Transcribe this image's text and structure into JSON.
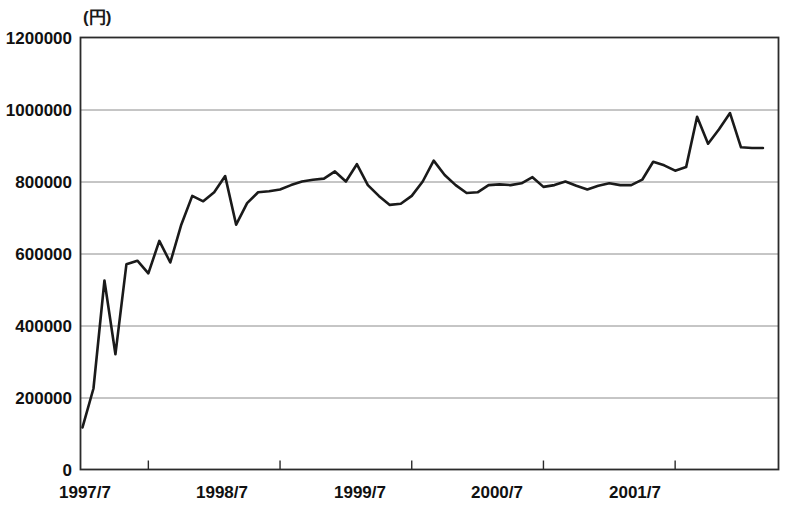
{
  "chart_data": {
    "type": "line",
    "title": "",
    "subtitle": "",
    "unit_label": "(円)",
    "xlabel": "",
    "ylabel": "",
    "ylim": [
      0,
      1200000
    ],
    "xlim": [
      "1997/1",
      "2002/4"
    ],
    "grid": true,
    "legend": "none",
    "y_ticks": [
      0,
      200000,
      400000,
      600000,
      800000,
      1000000,
      1200000
    ],
    "y_tick_labels": [
      "0",
      "200000",
      "400000",
      "600000",
      "800000",
      "1000000",
      "1200000"
    ],
    "x_ticks": [
      "1997/7",
      "1998/7",
      "1999/7",
      "2000/7",
      "2001/7"
    ],
    "x_tick_labels": [
      "1997/7",
      "1998/7",
      "1999/7",
      "2000/7",
      "2001/7"
    ],
    "line_color": "#1a1a1a",
    "line_width": 2.6,
    "series": [
      {
        "name": "金額",
        "x": [
          "1997/1",
          "1997/2",
          "1997/3",
          "1997/4",
          "1997/5",
          "1997/6",
          "1997/7",
          "1997/8",
          "1997/9",
          "1997/10",
          "1997/11",
          "1997/12",
          "1998/1",
          "1998/2",
          "1998/3",
          "1998/4",
          "1998/5",
          "1998/6",
          "1998/7",
          "1998/8",
          "1998/9",
          "1998/10",
          "1998/11",
          "1998/12",
          "1999/1",
          "1999/2",
          "1999/3",
          "1999/4",
          "1999/5",
          "1999/6",
          "1999/7",
          "1999/8",
          "1999/9",
          "1999/10",
          "1999/11",
          "1999/12",
          "2000/1",
          "2000/2",
          "2000/3",
          "2000/4",
          "2000/5",
          "2000/6",
          "2000/7",
          "2000/8",
          "2000/9",
          "2000/10",
          "2000/11",
          "2000/12",
          "2001/1",
          "2001/2",
          "2001/3",
          "2001/4",
          "2001/5",
          "2001/6",
          "2001/7",
          "2001/8",
          "2001/9",
          "2001/10",
          "2001/11",
          "2001/12",
          "2002/1",
          "2002/2",
          "2002/3"
        ],
        "values": [
          117000,
          225000,
          525000,
          320000,
          570000,
          580000,
          545000,
          635000,
          575000,
          680000,
          760000,
          745000,
          770000,
          815000,
          680000,
          740000,
          770000,
          773000,
          778000,
          790000,
          800000,
          805000,
          808000,
          828000,
          800000,
          848000,
          790000,
          760000,
          735000,
          738000,
          760000,
          800000,
          858000,
          818000,
          790000,
          768000,
          770000,
          790000,
          792000,
          790000,
          795000,
          812000,
          785000,
          790000,
          800000,
          788000,
          778000,
          788000,
          795000,
          790000,
          790000,
          805000,
          855000,
          845000,
          830000,
          840000,
          980000,
          905000,
          945000,
          990000,
          895000,
          893000,
          893000
        ]
      }
    ],
    "axis_frame_color": "#2b2b2b",
    "gridline_color": "#8c8c8c"
  }
}
